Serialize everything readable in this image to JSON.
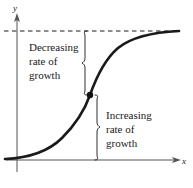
{
  "figure": {
    "kind": "calculus-graph",
    "background_color": "#ffffff",
    "ink_color": "#1a1a1a",
    "axes": {
      "y_label": "y",
      "x_label": "x",
      "x_axis": {
        "y": 160,
        "x_start": 6,
        "x_end": 180
      },
      "y_axis": {
        "x": 17,
        "y_start": 14,
        "y_end": 172
      }
    },
    "asymptote": {
      "name": "horizontal-asymptote",
      "style": "dashed",
      "y": 31,
      "x_start": 4,
      "x_end": 180
    },
    "inflection_point": {
      "x": 90,
      "y": 95,
      "radius": 3.2
    },
    "annotations": [
      {
        "id": "decreasing",
        "lines": [
          "Decreasing",
          "rate of",
          "growth"
        ],
        "text_x": 29,
        "text_y": 51,
        "line_height": 14,
        "brace": {
          "x": 84,
          "y_top": 31,
          "y_bottom": 95,
          "direction": "left"
        }
      },
      {
        "id": "increasing",
        "lines": [
          "Increasing",
          "rate of",
          "growth"
        ],
        "text_x": 106,
        "text_y": 119,
        "line_height": 14,
        "brace": {
          "x": 97,
          "y_top": 95,
          "y_bottom": 160,
          "direction": "right"
        }
      }
    ],
    "curve": {
      "name": "logistic-growth-curve",
      "stroke_width": 2.6,
      "path": "M 5,159 C 26,158 48,152 62,138 C 74,126 84,112 90,95 C 96,78 104,60 118,48 C 134,35 158,32 179,31"
    }
  },
  "chart_data": {
    "type": "line",
    "title": "",
    "xlabel": "x",
    "ylabel": "y",
    "series": [
      {
        "name": "logistic-growth-curve",
        "description": "S-shaped logistic curve with an inflection point; concave up before the point (increasing rate of growth) and concave down after it (decreasing rate of growth), approaching a horizontal asymptote.",
        "x": [
          0,
          0.5,
          1.0,
          1.5,
          2.0,
          2.5,
          3.0,
          3.5,
          4.0,
          4.5,
          5.0,
          5.5,
          6.0,
          6.5,
          7.0,
          7.5,
          8.0
        ],
        "y": [
          0.02,
          0.04,
          0.07,
          0.13,
          0.22,
          0.35,
          0.5,
          0.65,
          0.78,
          0.87,
          0.93,
          0.96,
          0.98,
          0.99,
          0.995,
          0.998,
          1.0
        ]
      }
    ],
    "annotations": [
      {
        "text": "Decreasing rate of growth",
        "region": "above-inflection"
      },
      {
        "text": "Increasing rate of growth",
        "region": "below-inflection"
      }
    ],
    "reference_lines": [
      {
        "orientation": "horizontal",
        "value": 1.0,
        "style": "dashed",
        "label": "asymptote"
      }
    ],
    "markers": [
      {
        "label": "inflection point",
        "x": 3.0,
        "y": 0.5
      }
    ],
    "grid": false,
    "legend": "none",
    "xlim": [
      0,
      8
    ],
    "ylim": [
      0,
      1.05
    ]
  }
}
